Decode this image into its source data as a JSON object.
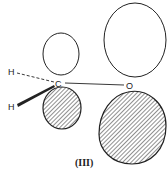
{
  "diagram": {
    "atoms": {
      "carbon": "C",
      "oxygen": "O",
      "hydrogen_top": "H",
      "hydrogen_bottom": "H"
    },
    "caption": "(III)",
    "orbitals": [
      {
        "atom": "C",
        "lobe": "upper",
        "shading": "none"
      },
      {
        "atom": "C",
        "lobe": "lower",
        "shading": "hatched"
      },
      {
        "atom": "O",
        "lobe": "upper",
        "shading": "none"
      },
      {
        "atom": "O",
        "lobe": "lower",
        "shading": "hatched"
      }
    ],
    "bonds": [
      {
        "from": "C",
        "to": "O",
        "style": "solid"
      },
      {
        "from": "C",
        "to": "H",
        "style": "dashed"
      },
      {
        "from": "C",
        "to": "H",
        "style": "wedge"
      }
    ],
    "colors": {
      "line": "#222222",
      "background": "#ffffff"
    }
  }
}
